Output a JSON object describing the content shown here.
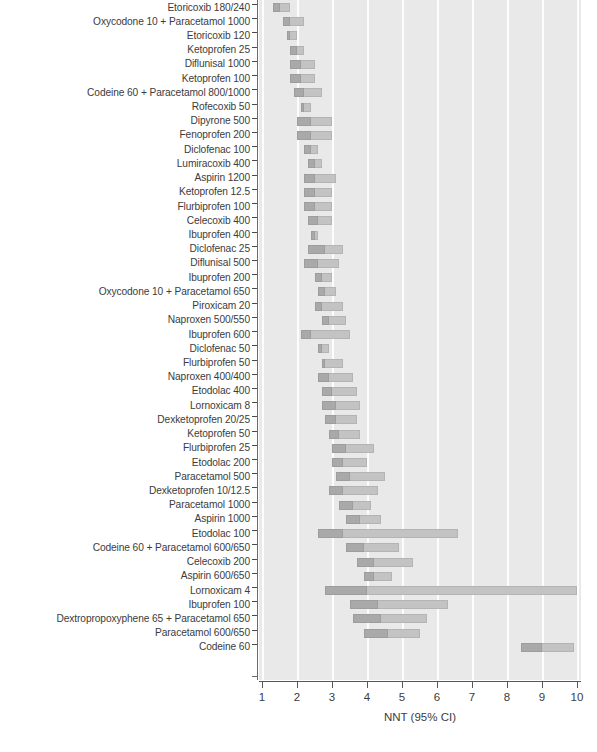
{
  "chart_data": {
    "type": "bar",
    "orientation": "horizontal",
    "title": "",
    "xlabel": "NNT (95% CI)",
    "ylabel": "",
    "xlim": [
      1,
      10
    ],
    "xticks": [
      1,
      2,
      3,
      4,
      5,
      6,
      7,
      8,
      9,
      10
    ],
    "grid": "vertical-white-gridlines",
    "legend": "none",
    "value_type": "confidence-interval-bars",
    "colors": {
      "plot_background": "#e9e9e9",
      "gridline": "#fdfdfd",
      "bar": "#c3c3c3",
      "bar_point": "#a9a9a9",
      "axis": "#585858",
      "text": "#3c3c3c"
    },
    "categories": [
      "Etoricoxib 180/240",
      "Oxycodone 10 + Paracetamol 1000",
      "Etoricoxib 120",
      "Ketoprofen 25",
      "Diflunisal 1000",
      "Ketoprofen 100",
      "Codeine 60 + Paracetamol 800/1000",
      "Rofecoxib 50",
      "Dipyrone 500",
      "Fenoprofen 200",
      "Diclofenac 100",
      "Lumiracoxib 400",
      "Aspirin 1200",
      "Ketoprofen 12.5",
      "Flurbiprofen 100",
      "Celecoxib 400",
      "Ibuprofen 400",
      "Diclofenac 25",
      "Diflunisal 500",
      "Ibuprofen 200",
      "Oxycodone 10 + Paracetamol 650",
      "Piroxicam 20",
      "Naproxen 500/550",
      "Ibuprofen 600",
      "Diclofenac 50",
      "Flurbiprofen 50",
      "Naproxen 400/400",
      "Etodolac 400",
      "Lornoxicam 8",
      "Dexketoprofen 20/25",
      "Ketoprofen 50",
      "Flurbiprofen 25",
      "Etodolac 200",
      "Paracetamol 500",
      "Dexketoprofen 10/12.5",
      "Paracetamol 1000",
      "Aspirin 1000",
      "Etodolac 100",
      "Codeine 60 + Paracetamol 600/650",
      "Celecoxib 200",
      "Aspirin 600/650",
      "Lornoxicam 4",
      "Ibuprofen 100",
      "Dextropropoxyphene 65 + Paracetamol 650",
      "Paracetamol 600/650",
      "Codeine 60"
    ],
    "intervals": [
      {
        "category": "Etoricoxib 180/240",
        "low": 1.3,
        "point": 1.5,
        "high": 1.8
      },
      {
        "category": "Oxycodone 10 + Paracetamol 1000",
        "low": 1.6,
        "point": 1.8,
        "high": 2.2
      },
      {
        "category": "Etoricoxib 120",
        "low": 1.7,
        "point": 1.8,
        "high": 2.0
      },
      {
        "category": "Ketoprofen 25",
        "low": 1.8,
        "point": 2.0,
        "high": 2.2
      },
      {
        "category": "Diflunisal 1000",
        "low": 1.8,
        "point": 2.1,
        "high": 2.5
      },
      {
        "category": "Ketoprofen 100",
        "low": 1.8,
        "point": 2.1,
        "high": 2.5
      },
      {
        "category": "Codeine 60 + Paracetamol 800/1000",
        "low": 1.9,
        "point": 2.2,
        "high": 2.7
      },
      {
        "category": "Rofecoxib 50",
        "low": 2.1,
        "point": 2.2,
        "high": 2.4
      },
      {
        "category": "Dipyrone 500",
        "low": 2.0,
        "point": 2.4,
        "high": 3.0
      },
      {
        "category": "Fenoprofen 200",
        "low": 2.0,
        "point": 2.4,
        "high": 3.0
      },
      {
        "category": "Diclofenac 100",
        "low": 2.2,
        "point": 2.4,
        "high": 2.6
      },
      {
        "category": "Lumiracoxib 400",
        "low": 2.3,
        "point": 2.5,
        "high": 2.7
      },
      {
        "category": "Aspirin 1200",
        "low": 2.2,
        "point": 2.5,
        "high": 3.1
      },
      {
        "category": "Ketoprofen 12.5",
        "low": 2.2,
        "point": 2.5,
        "high": 3.0
      },
      {
        "category": "Flurbiprofen 100",
        "low": 2.2,
        "point": 2.5,
        "high": 3.0
      },
      {
        "category": "Celecoxib 400",
        "low": 2.3,
        "point": 2.6,
        "high": 3.0
      },
      {
        "category": "Ibuprofen 400",
        "low": 2.4,
        "point": 2.5,
        "high": 2.6
      },
      {
        "category": "Diclofenac 25",
        "low": 2.3,
        "point": 2.8,
        "high": 3.3
      },
      {
        "category": "Diflunisal 500",
        "low": 2.2,
        "point": 2.6,
        "high": 3.2
      },
      {
        "category": "Ibuprofen 200",
        "low": 2.5,
        "point": 2.7,
        "high": 3.0
      },
      {
        "category": "Oxycodone 10 + Paracetamol 650",
        "low": 2.6,
        "point": 2.8,
        "high": 3.1
      },
      {
        "category": "Piroxicam 20",
        "low": 2.5,
        "point": 2.7,
        "high": 3.3
      },
      {
        "category": "Naproxen 500/550",
        "low": 2.7,
        "point": 2.9,
        "high": 3.4
      },
      {
        "category": "Ibuprofen 600",
        "low": 2.1,
        "point": 2.4,
        "high": 3.5
      },
      {
        "category": "Diclofenac 50",
        "low": 2.6,
        "point": 2.7,
        "high": 2.9
      },
      {
        "category": "Flurbiprofen 50",
        "low": 2.7,
        "point": 2.8,
        "high": 3.3
      },
      {
        "category": "Naproxen 400/400",
        "low": 2.6,
        "point": 2.9,
        "high": 3.6
      },
      {
        "category": "Etodolac 400",
        "low": 2.7,
        "point": 3.0,
        "high": 3.7
      },
      {
        "category": "Lornoxicam 8",
        "low": 2.7,
        "point": 3.1,
        "high": 3.8
      },
      {
        "category": "Dexketoprofen 20/25",
        "low": 2.8,
        "point": 3.1,
        "high": 3.7
      },
      {
        "category": "Ketoprofen 50",
        "low": 2.9,
        "point": 3.2,
        "high": 3.8
      },
      {
        "category": "Flurbiprofen 25",
        "low": 3.0,
        "point": 3.4,
        "high": 4.2
      },
      {
        "category": "Etodolac 200",
        "low": 3.0,
        "point": 3.3,
        "high": 4.0
      },
      {
        "category": "Paracetamol 500",
        "low": 3.1,
        "point": 3.5,
        "high": 4.5
      },
      {
        "category": "Dexketoprofen 10/12.5",
        "low": 2.9,
        "point": 3.3,
        "high": 4.3
      },
      {
        "category": "Paracetamol 1000",
        "low": 3.2,
        "point": 3.6,
        "high": 4.1
      },
      {
        "category": "Aspirin 1000",
        "low": 3.4,
        "point": 3.8,
        "high": 4.4
      },
      {
        "category": "Etodolac 100",
        "low": 2.6,
        "point": 3.3,
        "high": 6.6
      },
      {
        "category": "Codeine 60 + Paracetamol 600/650",
        "low": 3.4,
        "point": 3.9,
        "high": 4.9
      },
      {
        "category": "Celecoxib 200",
        "low": 3.7,
        "point": 4.2,
        "high": 5.3
      },
      {
        "category": "Aspirin 600/650",
        "low": 3.9,
        "point": 4.2,
        "high": 4.7
      },
      {
        "category": "Lornoxicam 4",
        "low": 2.8,
        "point": 4.0,
        "high": 10.0
      },
      {
        "category": "Ibuprofen 100",
        "low": 3.5,
        "point": 4.3,
        "high": 6.3
      },
      {
        "category": "Dextropropoxyphene 65 + Paracetamol 650",
        "low": 3.6,
        "point": 4.4,
        "high": 5.7
      },
      {
        "category": "Paracetamol 600/650",
        "low": 3.9,
        "point": 4.6,
        "high": 5.5
      },
      {
        "category": "Codeine 60",
        "low": 8.4,
        "point": 9.0,
        "high": 9.9
      }
    ]
  },
  "axis": {
    "x_tick_labels": [
      "1",
      "2",
      "3",
      "4",
      "5",
      "6",
      "7",
      "8",
      "9",
      "10"
    ],
    "x_axis_title": "NNT (95% CI)"
  }
}
